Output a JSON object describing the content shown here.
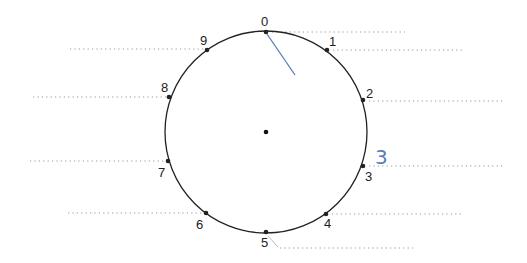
{
  "diagram": {
    "center": {
      "x": 266,
      "y": 132
    },
    "radius": 101,
    "points": [
      {
        "label": "0",
        "x": 266,
        "y": 32,
        "lx": 261,
        "ly": 26,
        "dash": [
          272,
          405,
          32
        ]
      },
      {
        "label": "1",
        "x": 327,
        "y": 50,
        "lx": 329,
        "ly": 46,
        "dash": [
          333,
          464,
          50
        ]
      },
      {
        "label": "2",
        "x": 363,
        "y": 100,
        "lx": 366,
        "ly": 98,
        "dash": [
          369,
          503,
          101
        ]
      },
      {
        "label": "3",
        "x": 363,
        "y": 166,
        "lx": 365,
        "ly": 181,
        "dash": [
          369,
          505,
          166
        ]
      },
      {
        "label": "4",
        "x": 326,
        "y": 214,
        "lx": 324,
        "ly": 228,
        "dash": [
          332,
          463,
          214
        ]
      },
      {
        "label": "5",
        "x": 266,
        "y": 232,
        "lx": 261,
        "ly": 247,
        "dash": [
          280,
          415,
          248
        ]
      },
      {
        "label": "6",
        "x": 206,
        "y": 213,
        "lx": 196,
        "ly": 229,
        "dash": [
          68,
          204,
          213
        ]
      },
      {
        "label": "7",
        "x": 168,
        "y": 161,
        "lx": 158,
        "ly": 177,
        "dash": [
          30,
          166,
          161
        ]
      },
      {
        "label": "8",
        "x": 169,
        "y": 97,
        "lx": 161,
        "ly": 92,
        "dash": [
          33,
          167,
          97
        ]
      },
      {
        "label": "9",
        "x": 207,
        "y": 50,
        "lx": 200,
        "ly": 45,
        "dash": [
          70,
          205,
          49
        ]
      }
    ],
    "annotation": {
      "text": "3",
      "x": 375,
      "y": 164,
      "color": "#5b7bb5"
    },
    "pointer": {
      "x1": 267,
      "y1": 34,
      "x2": 295,
      "y2": 75,
      "color": "#5b7bb5"
    }
  }
}
